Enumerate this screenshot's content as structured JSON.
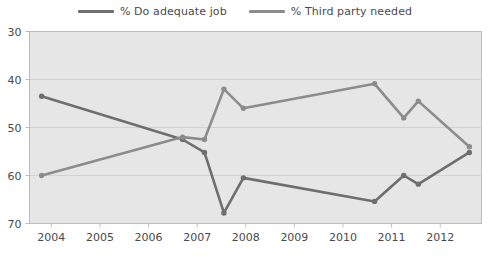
{
  "legend": {
    "position": "top",
    "entries": [
      {
        "label": "% Do adequate job",
        "color": "#6e6e6e",
        "swatch_name": "legend-swatch-do-adequate-job"
      },
      {
        "label": "% Third party needed",
        "color": "#8c8c8c",
        "swatch_name": "legend-swatch-third-party-needed"
      }
    ]
  },
  "axes": {
    "y_ticks": [
      "70",
      "60",
      "50",
      "40",
      "30"
    ],
    "x_ticks": [
      "2004",
      "2005",
      "2006",
      "2007",
      "2008",
      "2009",
      "2010",
      "2011",
      "2012"
    ]
  },
  "style": {
    "plot_background": "#e6e6e6",
    "plot_border": "#bdbdbd",
    "gridline_color": "#d2d2d2",
    "page_background": "#ffffff",
    "text_color": "#4a4a4a"
  },
  "chart_data": {
    "type": "line",
    "title": "",
    "xlabel": "",
    "ylabel": "",
    "xlim": [
      2003.55,
      2012.85
    ],
    "ylim": [
      30,
      70
    ],
    "y_ticks": [
      30,
      40,
      50,
      60,
      70
    ],
    "x_ticks": [
      2004,
      2005,
      2006,
      2007,
      2008,
      2009,
      2010,
      2011,
      2012
    ],
    "grid": true,
    "grid_axis": "y",
    "legend_position": "top",
    "markers": "circle",
    "series": [
      {
        "name": "% Do adequate job",
        "color": "#6e6e6e",
        "points": [
          {
            "x": 2003.8,
            "y": 56.5
          },
          {
            "x": 2006.7,
            "y": 47.5
          },
          {
            "x": 2007.15,
            "y": 44.8
          },
          {
            "x": 2007.55,
            "y": 32.2
          },
          {
            "x": 2007.95,
            "y": 39.5
          },
          {
            "x": 2010.65,
            "y": 34.6
          },
          {
            "x": 2011.25,
            "y": 40.0
          },
          {
            "x": 2011.55,
            "y": 38.2
          },
          {
            "x": 2012.6,
            "y": 44.8
          }
        ]
      },
      {
        "name": "% Third party needed",
        "color": "#8c8c8c",
        "points": [
          {
            "x": 2003.8,
            "y": 40.0
          },
          {
            "x": 2006.7,
            "y": 48.0
          },
          {
            "x": 2007.15,
            "y": 47.5
          },
          {
            "x": 2007.55,
            "y": 58.0
          },
          {
            "x": 2007.95,
            "y": 54.0
          },
          {
            "x": 2010.65,
            "y": 59.1
          },
          {
            "x": 2011.25,
            "y": 52.0
          },
          {
            "x": 2011.55,
            "y": 55.5
          },
          {
            "x": 2012.6,
            "y": 46.0
          }
        ]
      }
    ]
  }
}
